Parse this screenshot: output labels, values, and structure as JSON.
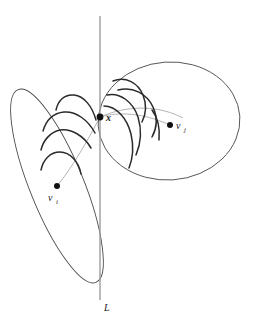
{
  "figure": {
    "type": "geometric-diagram",
    "background_color": "#ffffff",
    "stroke_color": "#2b2b2b",
    "light_stroke_color": "#9a9a9a",
    "point_color": "#111111",
    "labels": {
      "intersection_point": "x",
      "left_site": "v",
      "left_site_subscript": "i",
      "right_site": "v",
      "right_site_subscript": "j",
      "line": "L"
    },
    "points": [
      {
        "name": "x",
        "label": "x",
        "cx": 100,
        "cy": 117,
        "r": 3.4
      },
      {
        "name": "v-i",
        "label": "v",
        "sub": "i",
        "cx": 57,
        "cy": 186,
        "r": 3.0
      },
      {
        "name": "v-j",
        "label": "v",
        "sub": "j",
        "cx": 170,
        "cy": 125,
        "r": 3.0
      }
    ],
    "line_L": {
      "x": 100,
      "y_top": 16,
      "y_bottom": 300,
      "label": "L",
      "label_x": 104,
      "label_y": 311
    },
    "left_cell": {
      "cx": 57,
      "cy": 186,
      "rx": 27,
      "ry": 104,
      "rotation": -22
    },
    "right_cell": {
      "cx": 169,
      "cy": 121,
      "rx": 71,
      "ry": 59,
      "rotation": -4
    },
    "label_positions": {
      "x": {
        "x": 106,
        "y": 121
      },
      "v_i": {
        "x": 48,
        "y": 200
      },
      "v_i_sub": {
        "x": 56,
        "y": 203
      },
      "v_j": {
        "x": 176,
        "y": 129
      },
      "v_j_sub": {
        "x": 184,
        "y": 132
      }
    }
  }
}
